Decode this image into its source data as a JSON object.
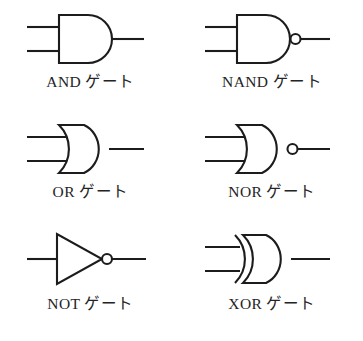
{
  "figure": {
    "background_color": "#ffffff",
    "line_color": "#1c1c1c",
    "columns": 2,
    "rows": 3
  },
  "gates": [
    {
      "id": "and",
      "label": "AND ゲート",
      "symbol_name": "and-gate-symbol",
      "shape": "d-shape",
      "inputs": 2,
      "output_bubble": false
    },
    {
      "id": "nand",
      "label": "NAND ゲート",
      "symbol_name": "nand-gate-symbol",
      "shape": "d-shape",
      "inputs": 2,
      "output_bubble": true
    },
    {
      "id": "or",
      "label": "OR ゲート",
      "symbol_name": "or-gate-symbol",
      "shape": "curved-back-shield",
      "inputs": 2,
      "output_bubble": false
    },
    {
      "id": "nor",
      "label": "NOR ゲート",
      "symbol_name": "nor-gate-symbol",
      "shape": "curved-back-shield",
      "inputs": 2,
      "output_bubble": true
    },
    {
      "id": "not",
      "label": "NOT ゲート",
      "symbol_name": "not-gate-symbol",
      "shape": "triangle",
      "inputs": 1,
      "output_bubble": true
    },
    {
      "id": "xor",
      "label": "XOR ゲート",
      "symbol_name": "xor-gate-symbol",
      "shape": "curved-back-shield-double-line",
      "inputs": 2,
      "output_bubble": false
    }
  ]
}
